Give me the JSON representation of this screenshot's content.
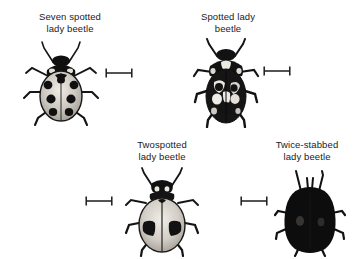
{
  "figure": {
    "background_color": "#ffffff",
    "ink_color": "#1b1b1b",
    "layout": "2x2 grid of labelled lady beetle illustrations with scale bars"
  },
  "panels": [
    {
      "id": "seven-spotted",
      "caption_line1": "Seven spotted",
      "caption_line2": "lady beetle",
      "scalebar_name": "scale-bar",
      "beetle_name": "seven-spotted-lady-beetle-illustration",
      "body_color": "#cfcac2",
      "marking_color": "#111111"
    },
    {
      "id": "spotted",
      "caption_line1": "Spotted lady",
      "caption_line2": "beetle",
      "scalebar_name": "scale-bar",
      "beetle_name": "spotted-lady-beetle-illustration",
      "body_color": "#141414",
      "marking_color": "#e8e5df"
    },
    {
      "id": "twospotted",
      "caption_line1": "Twospotted",
      "caption_line2": "lady beetle",
      "scalebar_name": "scale-bar",
      "beetle_name": "twospotted-lady-beetle-illustration",
      "body_color": "#d3cec6",
      "marking_color": "#111111"
    },
    {
      "id": "twice-stabbed",
      "caption_line1": "Twice-stabbed",
      "caption_line2": "lady beetle",
      "scalebar_name": "scale-bar",
      "beetle_name": "twice-stabbed-lady-beetle-illustration",
      "body_color": "#0d0d0d",
      "marking_color": "#4a4a4a"
    }
  ]
}
